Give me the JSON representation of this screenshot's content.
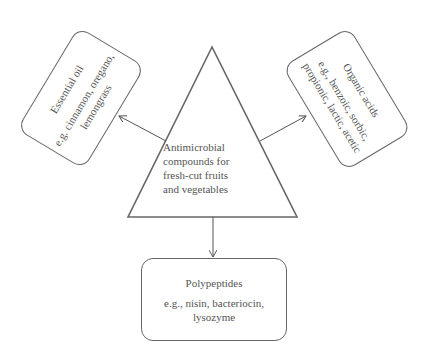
{
  "diagram": {
    "center": {
      "shape": "triangle",
      "label": "Antimicrobial\ncompounds for\n fresh-cut fruits\nand vegetables"
    },
    "nodes": [
      {
        "id": "essential-oil",
        "title": "Essential oil",
        "examples": "e.g. cinnamon, oregano,\nlemongrass",
        "position": "upper-left"
      },
      {
        "id": "organic-acids",
        "title": "Organic acids",
        "examples": "e.g., benzoic, sorbic,\npropionic, lactic, acetic",
        "position": "upper-right"
      },
      {
        "id": "polypeptides",
        "title": "Polypeptides",
        "examples": "e.g., nisin, bacteriocin,\nlysozyme",
        "position": "bottom"
      }
    ],
    "edges": [
      {
        "from": "center",
        "to": "essential-oil"
      },
      {
        "from": "center",
        "to": "organic-acids"
      },
      {
        "from": "center",
        "to": "polypeptides"
      }
    ],
    "colors": {
      "stroke": "#666666",
      "text": "#555555",
      "background": "#ffffff"
    }
  }
}
